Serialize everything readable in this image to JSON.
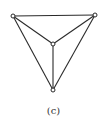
{
  "diagram": {
    "type": "graph",
    "caption": "(c)",
    "nodes": [
      {
        "id": "top-left"
      },
      {
        "id": "top-right"
      },
      {
        "id": "center"
      },
      {
        "id": "bottom"
      }
    ],
    "edges": [
      [
        "top-left",
        "top-right"
      ],
      [
        "top-left",
        "center"
      ],
      [
        "top-right",
        "center"
      ],
      [
        "top-left",
        "bottom"
      ],
      [
        "top-right",
        "bottom"
      ],
      [
        "center",
        "bottom"
      ]
    ]
  }
}
